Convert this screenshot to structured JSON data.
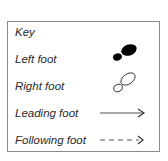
{
  "key": {
    "title": "Key",
    "items": [
      {
        "label": "Left foot",
        "symbol": "filled-footprint",
        "color": "#000000"
      },
      {
        "label": "Right foot",
        "symbol": "outline-footprint",
        "color": "#333333"
      },
      {
        "label": "Leading foot",
        "symbol": "solid-arrow",
        "color": "#555555"
      },
      {
        "label": "Following foot",
        "symbol": "dashed-arrow",
        "color": "#555555"
      }
    ]
  }
}
